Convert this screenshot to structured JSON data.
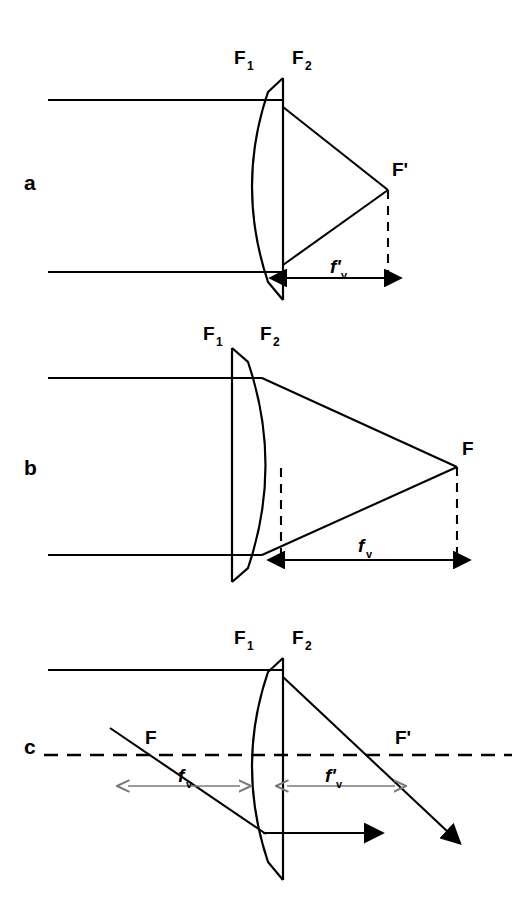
{
  "figure": {
    "background_color": "#ffffff",
    "line_color": "#000000",
    "accent_gray": "#7a7a7a",
    "width": 530,
    "height": 909
  },
  "panels": [
    {
      "id": "a",
      "label": "a",
      "description": "Plano-convex lens, convex side facing incoming collimated light; back vertex focal distance f'v measured from the flat rear vertex to the image focal point F'.",
      "lens_orientation": "convex-left-flat-right",
      "surface_labels": [
        {
          "name": "F1",
          "base": "F",
          "sub": "1"
        },
        {
          "name": "F2",
          "base": "F",
          "sub": "2"
        }
      ],
      "focal_point_label": "F'",
      "distance_label": {
        "base": "f'",
        "sub": "v"
      },
      "rays": "two horizontal parallel rays converging to F'"
    },
    {
      "id": "b",
      "label": "b",
      "description": "Same lens reversed, flat side facing incoming collimated light; front vertex focal distance fv measured from the convex rear vertex to the focal point F.",
      "lens_orientation": "flat-left-convex-right",
      "surface_labels": [
        {
          "name": "F1",
          "base": "F",
          "sub": "1"
        },
        {
          "name": "F2",
          "base": "F",
          "sub": "2"
        }
      ],
      "focal_point_label": "F",
      "distance_label": {
        "base": "f",
        "sub": "v"
      },
      "rays": "two horizontal parallel rays converging to F"
    },
    {
      "id": "c",
      "label": "c",
      "description": "Optical axis shown dashed with front focal point F on the left and rear focal point F' on the right; fv and f'v marked by gray double-headed arrows on either side of the lens.",
      "lens_orientation": "convex-left-flat-right",
      "surface_labels": [
        {
          "name": "F1",
          "base": "F",
          "sub": "1"
        },
        {
          "name": "F2",
          "base": "F",
          "sub": "2"
        }
      ],
      "focal_points": [
        {
          "name": "front-focal-point",
          "label": "F"
        },
        {
          "name": "rear-focal-point",
          "label": "F'"
        }
      ],
      "distance_labels": [
        {
          "name": "front-vertex-focal-length",
          "base": "f",
          "sub": "v"
        },
        {
          "name": "rear-vertex-focal-length",
          "base": "f'",
          "sub": "v"
        }
      ],
      "rays": "one horizontal ray with arrowhead and one oblique ray through F exiting through F'"
    }
  ]
}
